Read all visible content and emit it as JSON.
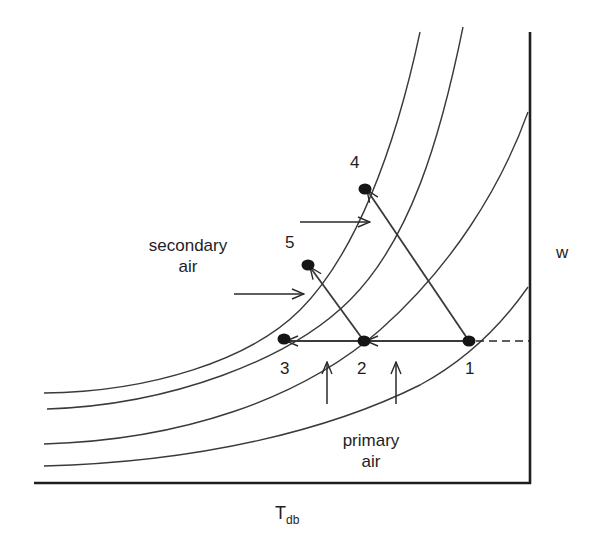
{
  "diagram": {
    "type": "psychrometric-process-diagram",
    "axes": {
      "x_label_main": "T",
      "x_label_sub": "db",
      "y_label": "w",
      "y_axis_side": "right"
    },
    "points": [
      {
        "id": "1",
        "label": "1",
        "x": 469,
        "y": 341
      },
      {
        "id": "2",
        "label": "2",
        "x": 364,
        "y": 341
      },
      {
        "id": "3",
        "label": "3",
        "x": 284,
        "y": 341
      },
      {
        "id": "4",
        "label": "4",
        "x": 365,
        "y": 188
      },
      {
        "id": "5",
        "label": "5",
        "x": 308,
        "y": 265
      }
    ],
    "process_lines": [
      {
        "from": "1",
        "to": "2"
      },
      {
        "from": "2",
        "to": "3"
      },
      {
        "from": "2",
        "to": "5"
      },
      {
        "from": "1",
        "to": "4"
      }
    ],
    "annotations": {
      "secondary_air_line1": "secondary",
      "secondary_air_line2": "air",
      "primary_air_line1": "primary",
      "primary_air_line2": "air"
    },
    "curve_count": 4,
    "colors": {
      "line": "#3a3a3a",
      "axis": "#1e1e1e",
      "point": "#151515",
      "background": "#ffffff"
    }
  }
}
